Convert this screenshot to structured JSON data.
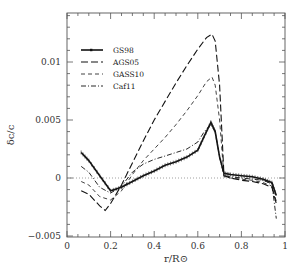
{
  "chart_data": {
    "type": "line",
    "title": "",
    "xlabel": "r/R⊙",
    "ylabel": "δc/c",
    "xlim": [
      0,
      1
    ],
    "ylim": [
      -0.005,
      0.0142
    ],
    "grid": false,
    "legend_position": "upper-left",
    "x_ticks": [
      "0",
      "0.2",
      "0.4",
      "0.6",
      "0.8",
      "1"
    ],
    "y_ticks": [
      "-0.005",
      "0",
      "0.005",
      "0.01"
    ],
    "reference_line": {
      "y": 0,
      "style": "dotted"
    },
    "series": [
      {
        "name": "GS98",
        "style": "solid-with-errorbars",
        "x": [
          0.065,
          0.1,
          0.15,
          0.2,
          0.25,
          0.3,
          0.35,
          0.4,
          0.45,
          0.5,
          0.55,
          0.6,
          0.63,
          0.66,
          0.68,
          0.7,
          0.72,
          0.75,
          0.8,
          0.85,
          0.9,
          0.94,
          0.96
        ],
        "y": [
          0.0022,
          0.0015,
          0.0002,
          -0.0011,
          -0.0008,
          -0.0003,
          0.0002,
          0.0006,
          0.0011,
          0.0014,
          0.0018,
          0.0024,
          0.0036,
          0.0048,
          0.004,
          0.0018,
          0.0004,
          0.0003,
          0.0002,
          0.0001,
          -0.0001,
          -0.0004,
          -0.0015
        ]
      },
      {
        "name": "AGS05",
        "style": "long-dash",
        "x": [
          0.065,
          0.1,
          0.15,
          0.175,
          0.2,
          0.25,
          0.3,
          0.35,
          0.4,
          0.45,
          0.5,
          0.55,
          0.6,
          0.64,
          0.665,
          0.68,
          0.7,
          0.72,
          0.75,
          0.8,
          0.85,
          0.9,
          0.94,
          0.96
        ],
        "y": [
          -0.0011,
          -0.0014,
          -0.0024,
          -0.0028,
          -0.0022,
          -0.0006,
          0.0013,
          0.0032,
          0.005,
          0.0066,
          0.0082,
          0.0097,
          0.0111,
          0.0121,
          0.0124,
          0.0118,
          0.008,
          0.0002,
          0.0,
          -0.0002,
          -0.0003,
          -0.0005,
          -0.0008,
          -0.0022
        ]
      },
      {
        "name": "GASS10",
        "style": "short-dash",
        "x": [
          0.065,
          0.1,
          0.15,
          0.2,
          0.25,
          0.3,
          0.35,
          0.4,
          0.45,
          0.5,
          0.55,
          0.6,
          0.64,
          0.665,
          0.68,
          0.7,
          0.72,
          0.75,
          0.8,
          0.85,
          0.9,
          0.94,
          0.96
        ],
        "y": [
          -0.0003,
          -0.0006,
          -0.0016,
          -0.0019,
          -0.0011,
          0.0003,
          0.0015,
          0.0025,
          0.0035,
          0.0046,
          0.0058,
          0.0071,
          0.0083,
          0.0087,
          0.008,
          0.005,
          0.0001,
          0.0,
          -0.0001,
          -0.0002,
          -0.0004,
          -0.0007,
          -0.002
        ]
      },
      {
        "name": "Caf11",
        "style": "dash-dot",
        "x": [
          0.065,
          0.1,
          0.15,
          0.2,
          0.25,
          0.3,
          0.35,
          0.4,
          0.45,
          0.5,
          0.55,
          0.6,
          0.63,
          0.66,
          0.68,
          0.7,
          0.72,
          0.75,
          0.8,
          0.85,
          0.9,
          0.94,
          0.96
        ],
        "y": [
          0.001,
          0.0005,
          -0.0008,
          -0.0013,
          -0.0007,
          0.0005,
          0.0012,
          0.0016,
          0.0019,
          0.0022,
          0.0025,
          0.0031,
          0.004,
          0.0046,
          0.004,
          0.0018,
          0.0002,
          0.0001,
          0.0,
          -0.0001,
          -0.0002,
          -0.0005,
          -0.0035
        ]
      }
    ]
  }
}
